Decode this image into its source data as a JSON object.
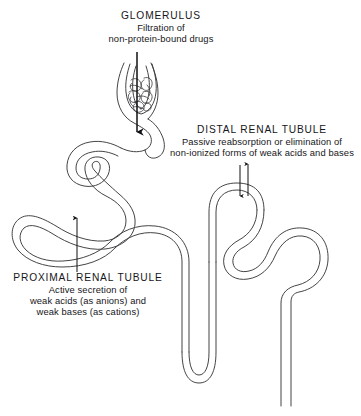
{
  "figure": {
    "background_color": "#ffffff",
    "line_color": "#3a3a3e",
    "arrow_color": "#111114",
    "text_color": "#16161a"
  },
  "annotations": {
    "glomerulus": {
      "title": "GLOMERULUS",
      "line1": "Filtration of",
      "line2": "non-protein-bound drugs",
      "arrow": "down-arrow-icon"
    },
    "distal": {
      "title": "DISTAL  RENAL  TUBULE",
      "line1": "Passive reabsorption or elimination of",
      "line2": "non-ionized forms of weak acids and bases",
      "arrow_in": "down-arrow-icon",
      "arrow_out": "up-arrow-icon"
    },
    "proximal": {
      "title": "PROXIMAL  RENAL  TUBULE",
      "line1": "Active secretion of",
      "line2": "weak acids (as anions) and",
      "line3": "weak bases (as cations)",
      "arrow": "up-arrow-icon"
    }
  },
  "structures": {
    "bowmans_capsule": "bowmans-capsule",
    "capillary_tuft": "glomerular-capillary-tuft",
    "proximal_convoluted_tubule": "proximal-convoluted-tubule",
    "loop_of_henle": "loop-of-henle",
    "distal_convoluted_tubule": "distal-convoluted-tubule",
    "collecting_duct": "collecting-duct"
  }
}
